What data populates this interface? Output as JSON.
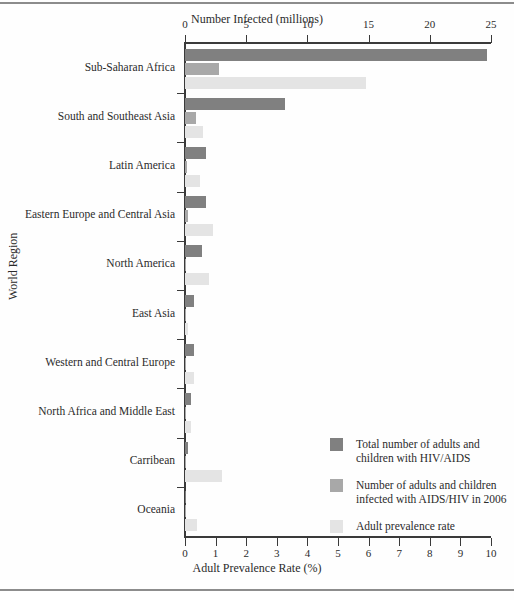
{
  "figure": {
    "y_axis_title": "World Region",
    "x_axis_top_title": "Number Infected (millions)",
    "x_axis_bottom_title": "Adult Prevalence Rate (%)"
  },
  "axis_top": {
    "ticks": [
      "0",
      "5",
      "10",
      "15",
      "20",
      "25"
    ]
  },
  "axis_bottom": {
    "ticks": [
      "0",
      "1",
      "2",
      "3",
      "4",
      "5",
      "6",
      "7",
      "8",
      "9",
      "10"
    ]
  },
  "legend": {
    "items": [
      {
        "label": "Total number of adults and\nchildren with HIV/AIDS",
        "color": "#808080"
      },
      {
        "label": "Number of adults and children\ninfected with AIDS/HIV in 2006",
        "color": "#a8a8a8"
      },
      {
        "label": "Adult prevalence rate",
        "color": "#e4e4e4"
      }
    ]
  },
  "chart_data": {
    "type": "bar",
    "orientation": "horizontal",
    "title": "",
    "xlabel": "Number Infected (millions)",
    "xlabel_secondary": "Adult Prevalence Rate (%)",
    "ylabel": "World Region",
    "xlim": [
      0,
      25
    ],
    "xlim_secondary": [
      0,
      10
    ],
    "grid": false,
    "legend_position": "lower-right",
    "categories": [
      "Sub-Saharan Africa",
      "South and Southeast Asia",
      "Latin America",
      "Eastern Europe and Central Asia",
      "North America",
      "East Asia",
      "Western and Central Europe",
      "North  Africa and Middle East",
      "Carribean",
      "Oceania"
    ],
    "series": [
      {
        "name": "Total number of adults and children with HIV/AIDS",
        "unit": "millions",
        "axis": "top",
        "color": "#808080",
        "values": [
          24.7,
          8.2,
          1.7,
          1.7,
          1.4,
          0.75,
          0.74,
          0.46,
          0.25,
          0.081
        ]
      },
      {
        "name": "Number of adults and children infected with AIDS/HIV in 2006",
        "unit": "millions",
        "axis": "top",
        "color": "#a8a8a8",
        "values": [
          2.8,
          0.86,
          0.14,
          0.27,
          0.06,
          0.1,
          0.05,
          0.07,
          0.03,
          0.007
        ]
      },
      {
        "name": "Adult prevalence rate",
        "unit": "percent",
        "axis": "bottom",
        "color": "#e4e4e4",
        "values": [
          5.9,
          0.6,
          0.5,
          0.9,
          0.8,
          0.1,
          0.3,
          0.2,
          1.2,
          0.4
        ]
      }
    ]
  }
}
